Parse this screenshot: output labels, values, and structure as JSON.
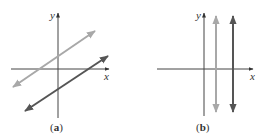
{
  "figure": {
    "panels": [
      {
        "id": "a",
        "caption": "(a)",
        "caption_letter": "a",
        "axes": {
          "x_label": "x",
          "y_label": "y",
          "origin": [
            58,
            69
          ],
          "x_range_px": [
            11,
            109
          ],
          "y_range_px": [
            13,
            118
          ]
        },
        "lines": [
          {
            "name": "light-line",
            "type": "sloped",
            "slope": "positive",
            "color": "#a8a8a8",
            "from": [
              13,
              87
            ],
            "to": [
              95,
              31
            ]
          },
          {
            "name": "dark-line",
            "type": "sloped",
            "slope": "positive",
            "color": "#555555",
            "from": [
              25,
              111
            ],
            "to": [
              108,
              56
            ]
          }
        ],
        "description": "Two parallel lines with the same positive slope and different y-intercepts"
      },
      {
        "id": "b",
        "caption": "(b)",
        "caption_letter": "b",
        "axes": {
          "x_label": "x",
          "y_label": "y",
          "origin": [
            204,
            69
          ],
          "x_range_px": [
            157,
            253
          ],
          "y_range_px": [
            13,
            116
          ]
        },
        "lines": [
          {
            "name": "light-line",
            "type": "vertical",
            "color": "#a8a8a8",
            "x": 216,
            "from_y": 16,
            "to_y": 112
          },
          {
            "name": "dark-line",
            "type": "vertical",
            "color": "#555555",
            "x": 233,
            "from_y": 16,
            "to_y": 112
          }
        ],
        "description": "Two parallel vertical lines with undefined slope"
      }
    ],
    "colors": {
      "axis": "#444444",
      "light_line": "#a8a8a8",
      "dark_line": "#555555",
      "text": "#333333",
      "background": "#ffffff"
    }
  }
}
